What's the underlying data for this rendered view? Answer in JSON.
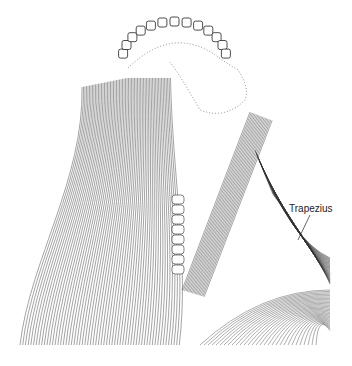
{
  "figure": {
    "labels": [
      {
        "text": "Trapezius",
        "target": "trapezius-muscle"
      }
    ],
    "colors": {
      "ink": "#222222",
      "background": "#ffffff",
      "stipple": "#999999"
    }
  }
}
